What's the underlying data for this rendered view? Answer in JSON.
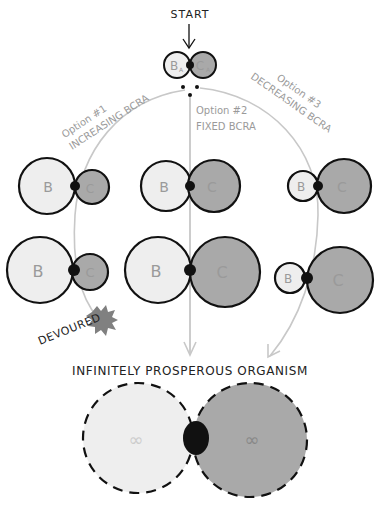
{
  "start": {
    "label": "START"
  },
  "cell_labels": {
    "b": "B",
    "b_sub": "A",
    "c": "C",
    "c_sub": "A"
  },
  "options": [
    {
      "id": "option1",
      "title": "Option #1",
      "subtitle": "INCREASING BCRA"
    },
    {
      "id": "option2",
      "title": "Option #2",
      "subtitle": "FIXED BCRA"
    },
    {
      "id": "option3",
      "title": "Option #3",
      "subtitle": "DECREASING BCRA"
    }
  ],
  "outcomes": {
    "devoured": "DEVOURED",
    "prosperous": "INFINITELY PROSPEROUS ORGANISM",
    "infinity": "∞"
  },
  "colors": {
    "b_fill": "#eeeeee",
    "c_fill": "#a9a9a9",
    "outline": "#111111",
    "path": "#c8c8c8",
    "label_gray": "#9a9a9a",
    "splat": "#808080"
  }
}
